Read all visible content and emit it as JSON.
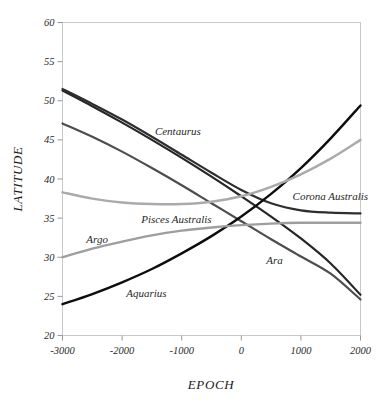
{
  "chart_data": {
    "type": "line",
    "title": "",
    "xlabel": "EPOCH",
    "ylabel": "LATITUDE",
    "xlim": [
      -3000,
      2000
    ],
    "ylim": [
      20,
      60
    ],
    "xticks": [
      -3000,
      -2000,
      -1000,
      0,
      1000,
      2000
    ],
    "xtick_labels": [
      "-3000",
      "-2000",
      "-1000",
      "0",
      "1000",
      "2000"
    ],
    "yticks": [
      20,
      25,
      30,
      35,
      40,
      45,
      50,
      55,
      60
    ],
    "ytick_labels": [
      "20",
      "25",
      "30",
      "35",
      "40",
      "45",
      "50",
      "55",
      "60"
    ],
    "grid": false,
    "legend_position": "inline-annotations",
    "x": [
      -3000,
      -2500,
      -2000,
      -1500,
      -1000,
      -500,
      0,
      500,
      1000,
      1500,
      2000
    ],
    "series": [
      {
        "name": "Centaurus",
        "color": "#262626",
        "width": 2.2,
        "values": [
          51.3,
          49.3,
          47.2,
          45.0,
          42.7,
          40.3,
          37.8,
          35.2,
          32.4,
          29.2,
          25.2
        ],
        "label_x": -1450,
        "label_y": 45.6
      },
      {
        "name": "Corona Australis",
        "color": "#2e2e2e",
        "width": 2.2,
        "values": [
          51.5,
          49.6,
          47.6,
          45.4,
          43.1,
          40.8,
          38.6,
          36.9,
          36.0,
          35.7,
          35.6
        ],
        "label_x": 860,
        "label_y": 37.3
      },
      {
        "name": "Ara",
        "color": "#4d4d4d",
        "width": 2.2,
        "values": [
          47.1,
          45.4,
          43.5,
          41.4,
          39.2,
          36.9,
          34.6,
          32.3,
          30.1,
          27.9,
          24.6
        ],
        "label_x": 420,
        "label_y": 29.2
      },
      {
        "name": "Aquarius",
        "color": "#0d0d0d",
        "width": 2.4,
        "values": [
          24.0,
          25.3,
          26.8,
          28.5,
          30.5,
          32.7,
          35.2,
          38.1,
          41.4,
          45.2,
          49.4
        ],
        "label_x": -1930,
        "label_y": 24.9
      },
      {
        "name": "Pisces Australis",
        "color": "#aaaaaa",
        "width": 2.4,
        "values": [
          38.3,
          37.5,
          37.0,
          36.8,
          36.8,
          37.1,
          37.8,
          39.0,
          40.6,
          42.6,
          45.0
        ],
        "label_x": -1680,
        "label_y": 34.4
      },
      {
        "name": "Argo",
        "color": "#9e9e9e",
        "width": 2.4,
        "values": [
          30.0,
          31.1,
          32.0,
          32.8,
          33.4,
          33.8,
          34.1,
          34.3,
          34.4,
          34.4,
          34.4
        ],
        "label_x": -2600,
        "label_y": 31.8
      }
    ]
  },
  "figure": {
    "background": "#ffffff",
    "frame_color": "#c9c9c9"
  }
}
